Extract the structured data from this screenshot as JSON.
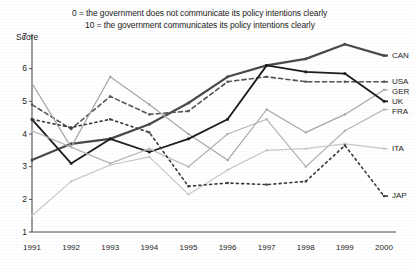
{
  "notes": {
    "line1": "0 = the government does not communicate its policy intentions clearly",
    "line2": "10 = the government communicates its policy intentions clearly"
  },
  "axes": {
    "y_axis_title": "Score",
    "y_ticks": [
      "7",
      "6",
      "5",
      "4",
      "3",
      "2",
      "1"
    ],
    "x_ticks": [
      "1991",
      "1992",
      "1993",
      "1994",
      "1995",
      "1996",
      "1997",
      "1998",
      "1999",
      "2000"
    ]
  },
  "legend": {
    "items": [
      {
        "label": "CAN"
      },
      {
        "label": "USA"
      },
      {
        "label": "GER"
      },
      {
        "label": "UK"
      },
      {
        "label": "FRA"
      },
      {
        "label": "ITA"
      },
      {
        "label": "JAP"
      }
    ]
  },
  "chart_data": {
    "type": "line",
    "title": "",
    "subtitle": "0 = the government does not communicate its policy intentions clearly / 10 = the government communicates its policy intentions clearly",
    "xlabel": "",
    "ylabel": "Score",
    "x": [
      1991,
      1992,
      1993,
      1994,
      1995,
      1996,
      1997,
      1998,
      1999,
      2000
    ],
    "ylim": [
      1,
      7
    ],
    "xlim": [
      1991,
      2000
    ],
    "grid": false,
    "legend_position": "right",
    "series": [
      {
        "name": "CAN",
        "color": "#4a4a4a",
        "style": "solid",
        "width": 2.2,
        "values": [
          3.2,
          3.7,
          3.85,
          4.3,
          4.95,
          5.75,
          6.1,
          6.3,
          6.75,
          6.4
        ]
      },
      {
        "name": "USA",
        "color": "#555555",
        "style": "dashed",
        "width": 1.6,
        "values": [
          4.9,
          4.15,
          5.15,
          4.6,
          4.7,
          5.6,
          5.75,
          5.6,
          5.6,
          5.6
        ]
      },
      {
        "name": "GER",
        "color": "#a8a8a8",
        "style": "solid",
        "width": 1.2,
        "values": [
          5.55,
          3.6,
          5.75,
          4.9,
          4.0,
          3.2,
          4.75,
          4.05,
          4.6,
          5.35
        ]
      },
      {
        "name": "UK",
        "color": "#1c1c1c",
        "style": "solid",
        "width": 1.8,
        "values": [
          4.45,
          3.1,
          3.85,
          3.45,
          3.85,
          4.45,
          6.1,
          5.9,
          5.85,
          5.0
        ]
      },
      {
        "name": "FRA",
        "color": "#b5b5b5",
        "style": "solid",
        "width": 1.2,
        "values": [
          4.1,
          3.6,
          3.1,
          3.55,
          3.0,
          4.0,
          4.45,
          3.0,
          4.1,
          4.75
        ]
      },
      {
        "name": "ITA",
        "color": "#c9c9c9",
        "style": "solid",
        "width": 1.2,
        "values": [
          1.5,
          2.55,
          3.05,
          3.3,
          2.15,
          2.9,
          3.5,
          3.55,
          3.7,
          3.55
        ]
      },
      {
        "name": "JAP",
        "color": "#3a3a3a",
        "style": "dotted",
        "width": 1.6,
        "values": [
          4.45,
          4.2,
          4.45,
          4.05,
          2.4,
          2.5,
          2.45,
          2.55,
          3.65,
          2.1
        ]
      }
    ]
  }
}
